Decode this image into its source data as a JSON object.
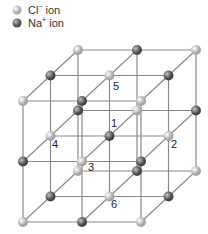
{
  "legend": {
    "items": [
      {
        "ion": "Cl",
        "charge": "−",
        "suffix": " ion",
        "color": "#c8c8c8"
      },
      {
        "ion": "Na",
        "charge": "+",
        "suffix": " ion",
        "color": "#6e6e6e"
      }
    ]
  },
  "lattice": {
    "size": 3,
    "origin_front_top_left": [
      23,
      101
    ],
    "dx": 59,
    "dy": 60.5,
    "depth_offset": [
      27.5,
      -25.5
    ],
    "cl_parity": "even",
    "colors": {
      "cl": "#c8c8c8",
      "na": "#6e6e6e",
      "line": "#8a8a8a"
    },
    "labels": [
      {
        "text": "1",
        "x": 111,
        "y": 127
      },
      {
        "text": "2",
        "x": 171,
        "y": 148
      },
      {
        "text": "3",
        "x": 88,
        "y": 171
      },
      {
        "text": "4",
        "x": 52,
        "y": 148
      },
      {
        "text": "5",
        "x": 113,
        "y": 90
      },
      {
        "text": "6",
        "x": 111,
        "y": 208
      }
    ]
  }
}
